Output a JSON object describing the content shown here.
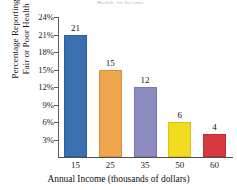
{
  "chart_data": {
    "type": "bar",
    "title": "Health, by Income",
    "title_visible": false,
    "categories": [
      "15",
      "25",
      "35",
      "50",
      "60"
    ],
    "values": [
      21,
      15,
      12,
      6,
      4
    ],
    "value_labels": [
      "21",
      "15",
      "12",
      "6",
      "4"
    ],
    "xlabel": "Annual Income (thousands of dollars)",
    "ylabel_line1": "Percentage Reporting",
    "ylabel_line2": "Fair or Poor Health",
    "ylim": [
      0,
      24
    ],
    "yticks": [
      24,
      21,
      18,
      15,
      12,
      9,
      6,
      3
    ],
    "ytick_labels": [
      "24%",
      "21%",
      "18%",
      "15%",
      "12%",
      "9%",
      "6%",
      "3%"
    ],
    "grid": true,
    "legend": false,
    "bar_colors": [
      "#3a6fb0",
      "#eda54e",
      "#8d8cc0",
      "#f2dc1f",
      "#d63a3f"
    ],
    "bar_edge_colors": [
      "#2f5d97",
      "#d98f3c",
      "#7a79ad",
      "#d9c312",
      "#b92f35"
    ]
  }
}
